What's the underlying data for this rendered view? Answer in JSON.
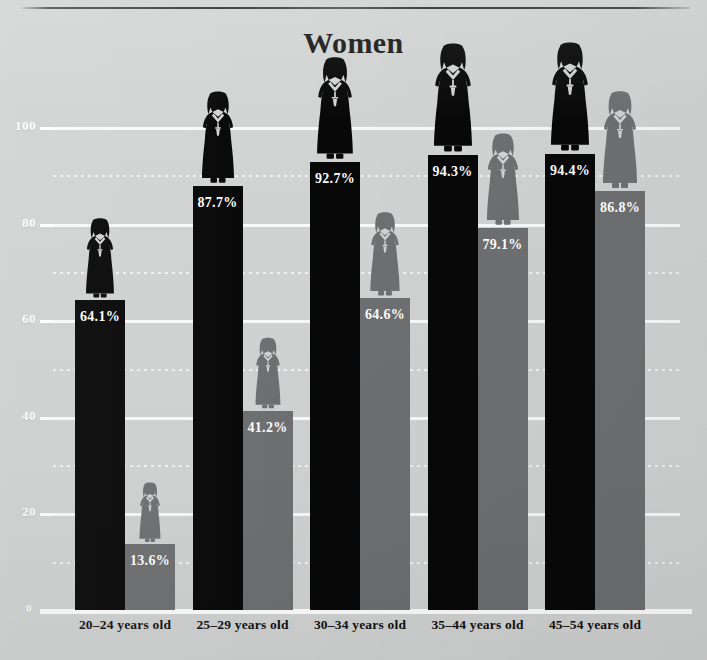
{
  "chart_data": {
    "type": "bar",
    "title": "Women",
    "xlabel": "",
    "ylabel": "",
    "ylim": [
      0,
      100
    ],
    "grid": true,
    "legend_position": "none",
    "categories": [
      "20–24 years old",
      "25–29 years old",
      "30–34 years old",
      "35–44 years old",
      "45–54 years old"
    ],
    "ytick_labels": [
      "100",
      "80",
      "60",
      "40",
      "20",
      "0"
    ],
    "ytick_values": [
      100,
      80,
      60,
      40,
      20,
      0
    ],
    "minor_gridline_values": [
      90,
      70,
      50,
      30,
      10
    ],
    "series": [
      {
        "name": "black",
        "color": "#080808",
        "values": [
          64.1,
          87.7,
          92.7,
          94.3,
          94.4
        ],
        "labels": [
          "64.1%",
          "87.7%",
          "92.7%",
          "94.3%",
          "94.4%"
        ]
      },
      {
        "name": "gray",
        "color": "#6f7071",
        "values": [
          13.6,
          41.2,
          64.6,
          79.1,
          86.8
        ],
        "labels": [
          "13.6%",
          "41.2%",
          "64.6%",
          "79.1%",
          "86.8%"
        ]
      }
    ]
  },
  "figure": {
    "title": "Women",
    "background_color": "#d2d3d3",
    "gridline_color": "#fafafa",
    "label_text_color": "#ffffff",
    "axis_label_color": "#111111",
    "icon_name": "woman-pictogram"
  }
}
